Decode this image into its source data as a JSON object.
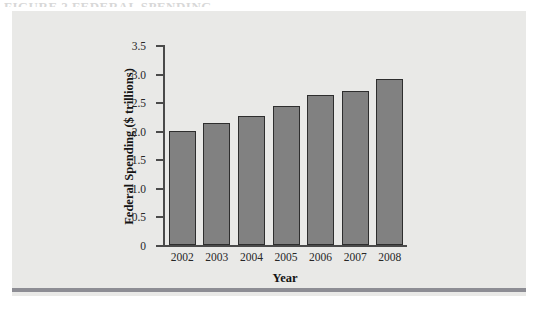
{
  "page": {
    "cutoff_heading": "FIGURE 2  FEDERAL SPENDING"
  },
  "chart_data": {
    "type": "bar",
    "title": "",
    "subtitle": "",
    "xlabel": "Year",
    "ylabel": "Federal Spending ($ trillions)",
    "categories": [
      "2002",
      "2003",
      "2004",
      "2005",
      "2006",
      "2007",
      "2008"
    ],
    "values": [
      2.0,
      2.13,
      2.25,
      2.43,
      2.62,
      2.7,
      2.91
    ],
    "ylim": [
      0,
      3.5
    ],
    "ytick_labels": [
      "3.5",
      "3.0",
      "2.5",
      "2.0",
      "1.5",
      "1.0",
      "0.5",
      "0"
    ],
    "ytick_values": [
      3.5,
      3.0,
      2.5,
      2.0,
      1.5,
      1.0,
      0.5,
      0
    ],
    "grid": false,
    "legend": false,
    "legend_position": "none",
    "colors": {
      "bar_fill": "#818181",
      "bar_border": "#2e2e2e",
      "panel_background": "#e9e9e7",
      "rule": "#8d8d94",
      "axis": "#4a4a4a",
      "text": "#272727"
    }
  }
}
